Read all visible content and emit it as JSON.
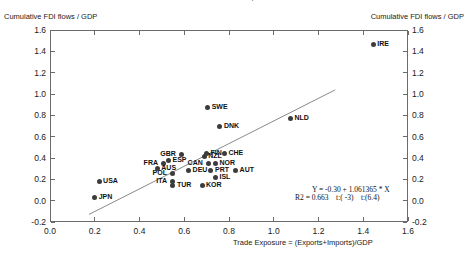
{
  "chart": {
    "title": "FDI and Trade Exposure",
    "ylabel_left": "Cumulative FDI flows / GDP",
    "ylabel_right": "Cumulative FDI flows / GDP",
    "xlabel": "Trade Exposure = (Exports+Imports)/GDP",
    "equation_line1": "Y = -0.30 + 1.061365 * X",
    "equation_line2": "R2 = 0.663    t:( -3)    t:(6.4)",
    "point_color": "#3c3c3c",
    "axis_color": "#6b6b6b"
  },
  "chart_data": {
    "type": "scatter",
    "title": "FDI and Trade Exposure",
    "xlabel": "Trade Exposure = (Exports+Imports)/GDP",
    "ylabel": "Cumulative FDI flows / GDP",
    "xlim": [
      0.0,
      1.6
    ],
    "ylim": [
      -0.2,
      1.6
    ],
    "xticks": [
      "0.0",
      "0.2",
      "0.4",
      "0.6",
      "0.8",
      "1.0",
      "1.2",
      "1.4",
      "1.6"
    ],
    "yticks": [
      "-0.2",
      "0.0",
      "0.2",
      "0.4",
      "0.6",
      "0.8",
      "1.0",
      "1.2",
      "1.4",
      "1.6"
    ],
    "grid": false,
    "legend": "none",
    "regression": {
      "intercept": -0.3,
      "slope": 1.061365,
      "r2": 0.663,
      "t_intercept": -3,
      "t_slope": 6.4,
      "label": "Y = -0.30 + 1.061365 * X",
      "stats_label": "R2 = 0.663    t:( -3)    t:(6.4)",
      "x_start": 0.17,
      "x_end": 1.27
    },
    "points": [
      {
        "label": "IRE",
        "x": 1.44,
        "y": 1.47,
        "label_side": "right"
      },
      {
        "label": "NLD",
        "x": 1.07,
        "y": 0.78,
        "label_side": "right"
      },
      {
        "label": "SWE",
        "x": 0.7,
        "y": 0.88,
        "label_side": "right"
      },
      {
        "label": "DNK",
        "x": 0.755,
        "y": 0.705,
        "label_side": "right"
      },
      {
        "label": "CHE",
        "x": 0.775,
        "y": 0.455,
        "label_side": "right"
      },
      {
        "label": "FIN",
        "x": 0.695,
        "y": 0.455,
        "label_side": "right"
      },
      {
        "label": "NZL",
        "x": 0.685,
        "y": 0.425,
        "label_side": "right"
      },
      {
        "label": "GBR",
        "x": 0.585,
        "y": 0.445,
        "label_side": "left"
      },
      {
        "label": "NOR",
        "x": 0.735,
        "y": 0.355,
        "label_side": "right"
      },
      {
        "label": "CAN",
        "x": 0.705,
        "y": 0.355,
        "label_side": "left"
      },
      {
        "label": "ESP",
        "x": 0.525,
        "y": 0.39,
        "label_side": "right"
      },
      {
        "label": "FRA",
        "x": 0.505,
        "y": 0.355,
        "label_side": "left"
      },
      {
        "label": "AUS",
        "x": 0.475,
        "y": 0.31,
        "label_side": "right"
      },
      {
        "label": "AUT",
        "x": 0.825,
        "y": 0.29,
        "label_side": "right"
      },
      {
        "label": "PRT",
        "x": 0.715,
        "y": 0.295,
        "label_side": "right"
      },
      {
        "label": "DEU",
        "x": 0.615,
        "y": 0.295,
        "label_side": "right"
      },
      {
        "label": "POL",
        "x": 0.545,
        "y": 0.265,
        "label_side": "left"
      },
      {
        "label": "ISL",
        "x": 0.735,
        "y": 0.225,
        "label_side": "right"
      },
      {
        "label": "USA",
        "x": 0.215,
        "y": 0.185,
        "label_side": "right"
      },
      {
        "label": "KOR",
        "x": 0.675,
        "y": 0.155,
        "label_side": "right"
      },
      {
        "label": "TUR",
        "x": 0.545,
        "y": 0.155,
        "label_side": "right"
      },
      {
        "label": "ITA",
        "x": 0.545,
        "y": 0.19,
        "label_side": "left"
      },
      {
        "label": "JPN",
        "x": 0.195,
        "y": 0.035,
        "label_side": "right"
      }
    ]
  }
}
